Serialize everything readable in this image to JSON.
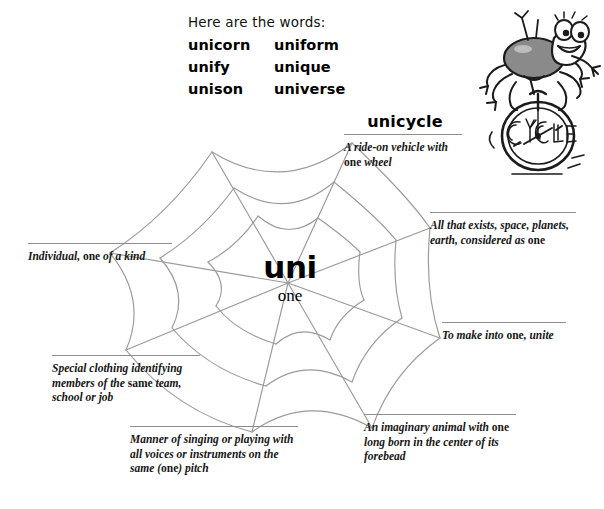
{
  "worksheet": {
    "root": "uni",
    "root_meaning": "one"
  },
  "wordlist": {
    "intro": "Here are the words:",
    "left_column": [
      "unicorn",
      "unify",
      "unison"
    ],
    "right_column": [
      "uniform",
      "unique",
      "universe"
    ]
  },
  "definitions": {
    "unicycle": {
      "heading": "unicycle",
      "text_part1": "A ride-on vehicle with ",
      "bold": "one",
      "text_part2": " wheel"
    },
    "universe": {
      "text_part1": "All that exists, space, planets, earth, considered as ",
      "bold": "one",
      "text_part2": ""
    },
    "unify": {
      "text_part1": "To make into ",
      "bold": "one",
      "text_part2": ", unite"
    },
    "unicorn": {
      "text_part1": "An imaginary animal with ",
      "bold": "one",
      "text_part2": " long born in the center of its forebead"
    },
    "unison": {
      "text_part1": "Manner of singing or playing with all voices or instruments on the same (",
      "bold": "one",
      "text_part2": ") pitch"
    },
    "uniform": {
      "text_part1": "Special clothing identifying members of the ",
      "bold": "same",
      "text_part2": " team, school or job"
    },
    "unique": {
      "text_part1": "Individual, ",
      "bold": "one",
      "text_part2": " of a kind"
    }
  },
  "illustration": {
    "name": "spider-on-unicycle",
    "wheel_text": "CYCLE"
  },
  "colors": {
    "web_line": "#9a9a9a",
    "rule_line": "#8d8d8d",
    "ink": "#161616",
    "paper": "#ffffff",
    "spider_body": "#8a8a8a"
  }
}
